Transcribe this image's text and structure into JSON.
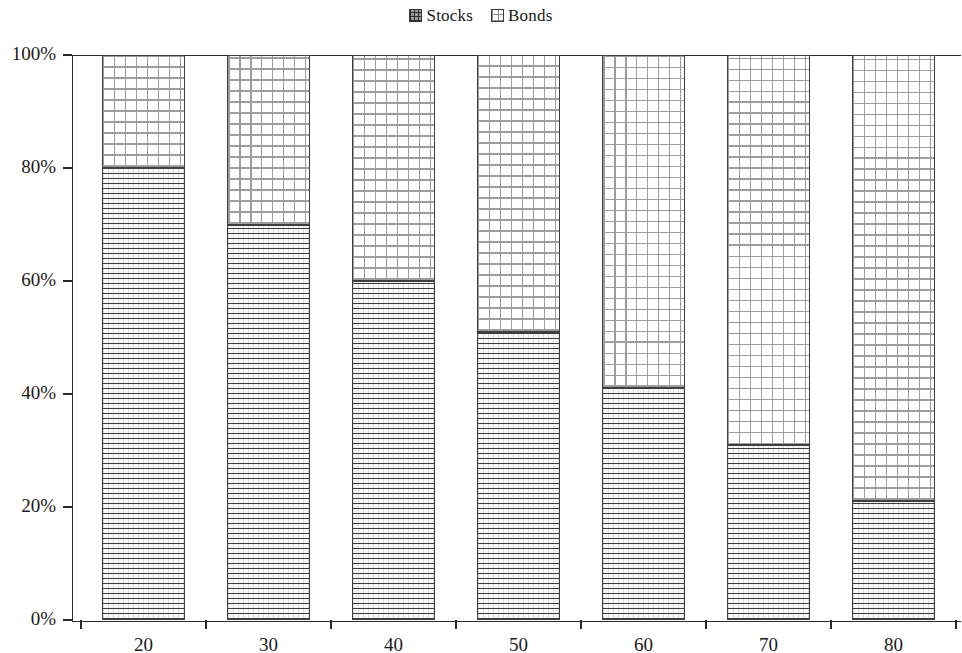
{
  "legend": {
    "position": "top-center",
    "entries": [
      {
        "label": "Stocks",
        "swatch": "dark-grid-swatch-icon",
        "color": "#3b3b3b"
      },
      {
        "label": "Bonds",
        "swatch": "light-grid-swatch-icon",
        "color": "#9d9d9d"
      }
    ]
  },
  "axes": {
    "y_ticks": [
      "0%",
      "20%",
      "40%",
      "60%",
      "80%",
      "100%"
    ],
    "x_ticks": [
      "20",
      "30",
      "40",
      "50",
      "60",
      "70",
      "80"
    ]
  },
  "chart_data": {
    "type": "bar",
    "stacked": true,
    "stack_total": 100,
    "title": "",
    "subtitle": "",
    "xlabel": "",
    "ylabel": "",
    "categories": [
      "20",
      "30",
      "40",
      "50",
      "60",
      "70",
      "80"
    ],
    "series": [
      {
        "name": "Stocks",
        "values": [
          80,
          70,
          60,
          51,
          41,
          31,
          21
        ]
      },
      {
        "name": "Bonds",
        "values": [
          20,
          30,
          40,
          49,
          59,
          69,
          79
        ]
      }
    ],
    "ylim": [
      0,
      100
    ],
    "yticks": [
      0,
      20,
      40,
      60,
      80,
      100
    ],
    "ytick_labels": [
      "0%",
      "20%",
      "40%",
      "60%",
      "80%",
      "100%"
    ],
    "grid": false,
    "legend_position": "top-center",
    "annotations": []
  }
}
